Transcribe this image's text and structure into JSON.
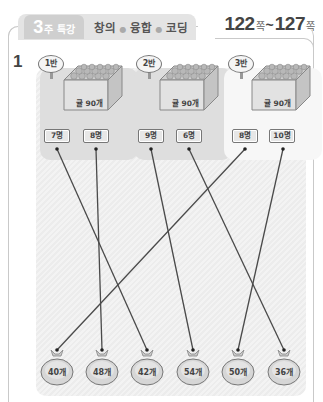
{
  "header": {
    "week_number": "3",
    "week_label": "주 특강",
    "title_parts": [
      "창의",
      "융합",
      "코딩"
    ],
    "page_start": "122",
    "page_end": "127",
    "page_suffix": "쪽",
    "tilde": "~"
  },
  "question": {
    "number": "1"
  },
  "classes": [
    {
      "name": "1반",
      "crate_label": "귤 90개",
      "counts": [
        "7명",
        "8명"
      ]
    },
    {
      "name": "2반",
      "crate_label": "귤 90개",
      "counts": [
        "9명",
        "6명"
      ]
    },
    {
      "name": "3반",
      "crate_label": "귤 90개",
      "counts": [
        "8명",
        "10명"
      ]
    }
  ],
  "bags": [
    "40개",
    "48개",
    "42개",
    "54개",
    "50개",
    "36개"
  ],
  "connections": [
    {
      "from": "1반 7명",
      "to": "42개"
    },
    {
      "from": "1반 8명",
      "to": "48개"
    },
    {
      "from": "2반 9명",
      "to": "54개"
    },
    {
      "from": "2반 6명",
      "to": "36개"
    },
    {
      "from": "3반 8명",
      "to": "40개"
    },
    {
      "from": "3반 10명",
      "to": "50개"
    }
  ],
  "colors": {
    "border": "#c9c9c9",
    "line": "#4a4a4a",
    "card": "#dedede"
  }
}
